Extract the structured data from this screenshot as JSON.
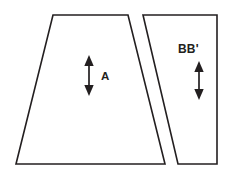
{
  "figure": {
    "type": "line-diagram",
    "background_color": "#ffffff",
    "stroke_color": "#231f20",
    "fill_color": "#ffffff",
    "width": 235,
    "height": 179
  },
  "shapes": [
    {
      "id": "left-trapezoid",
      "name": "A",
      "points": "53,15 128,15 165,164 16,164",
      "description": "large trapezoid, wider at bottom"
    },
    {
      "id": "right-quadrilateral",
      "name": "BB'",
      "points": "143,15 217,15 217,164 178,164",
      "description": "narrow slanted quadrilateral"
    }
  ],
  "labels": [
    {
      "id": "label-a",
      "text": "A",
      "x": 101,
      "y": 71
    },
    {
      "id": "label-bb",
      "text": "BB'",
      "x": 178,
      "y": 43
    }
  ],
  "arrows": [
    {
      "id": "arrow-a",
      "orientation": "vertical-double-headed",
      "x": 89,
      "y_top": 56,
      "y_bottom": 95,
      "associated_label": "A"
    },
    {
      "id": "arrow-bb",
      "orientation": "vertical-double-headed",
      "x": 199,
      "y_top": 62,
      "y_bottom": 99,
      "associated_label": "BB'"
    }
  ]
}
